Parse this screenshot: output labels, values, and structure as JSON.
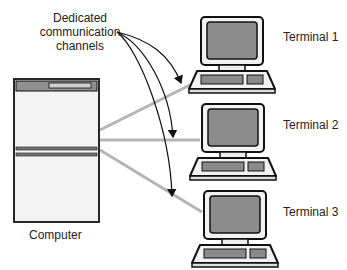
{
  "diagram": {
    "callout": {
      "line1": "Dedicated",
      "line2": "communication",
      "line3": "channels"
    },
    "computer_label": "Computer",
    "terminals": [
      {
        "label": "Terminal 1"
      },
      {
        "label": "Terminal 2"
      },
      {
        "label": "Terminal 3"
      }
    ],
    "colors": {
      "link_line": "#b5b5b5",
      "outline": "#111111",
      "screen": "#8c8c8c",
      "keyboard": "#8a8a8a",
      "body_fill": "#f3f3f3"
    }
  }
}
